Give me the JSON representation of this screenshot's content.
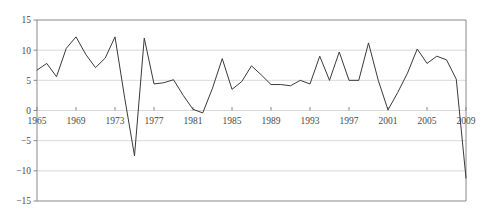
{
  "chart_data": {
    "type": "line",
    "title": "",
    "subtitle": "",
    "xlabel": "",
    "ylabel": "",
    "xlim": [
      1965,
      2009
    ],
    "ylim": [
      -15,
      15
    ],
    "grid": true,
    "legend": null,
    "y_ticks": [
      15,
      10,
      5,
      0,
      -5,
      -10,
      -15
    ],
    "y_tick_labels": [
      "15",
      "10",
      "5",
      "0",
      "−5",
      "−10",
      "−15"
    ],
    "x_ticks": [
      1965,
      1969,
      1973,
      1977,
      1981,
      1985,
      1989,
      1993,
      1997,
      2001,
      2005,
      2009
    ],
    "x_tick_labels": [
      "1965",
      "1969",
      "1973",
      "1977",
      "1981",
      "1985",
      "1989",
      "1993",
      "1997",
      "2001",
      "2005",
      "2009"
    ],
    "series": [
      {
        "name": "series-1",
        "color": "#3a3a3a",
        "x": [
          1965,
          1966,
          1967,
          1968,
          1969,
          1970,
          1971,
          1972,
          1973,
          1974,
          1975,
          1976,
          1977,
          1978,
          1979,
          1980,
          1981,
          1982,
          1983,
          1984,
          1985,
          1986,
          1987,
          1988,
          1989,
          1990,
          1991,
          1992,
          1993,
          1994,
          1995,
          1996,
          1997,
          1998,
          1999,
          2000,
          2001,
          2002,
          2003,
          2004,
          2005,
          2006,
          2007,
          2008,
          2009
        ],
        "values": [
          6.7,
          7.8,
          5.6,
          10.3,
          12.2,
          9.3,
          7.1,
          8.7,
          12.2,
          2.0,
          -7.5,
          12.0,
          4.4,
          4.6,
          5.1,
          2.5,
          0.2,
          -0.4,
          3.7,
          8.6,
          3.5,
          4.8,
          7.4,
          5.9,
          4.3,
          4.3,
          4.1,
          5.0,
          4.4,
          9.0,
          5.0,
          9.7,
          5.0,
          5.0,
          11.2,
          5.0,
          0.1,
          3.0,
          6.2,
          10.2,
          7.8,
          9.0,
          8.4,
          5.2,
          -11.2
        ]
      }
    ]
  },
  "axes": {
    "plot_left_px": 37,
    "plot_right_px": 466,
    "plot_top_px": 20,
    "plot_bottom_px": 201,
    "frame_color": "#888888",
    "gridline_color": "#cfcfcf",
    "tick_color": "#888888",
    "background": "#ffffff"
  }
}
